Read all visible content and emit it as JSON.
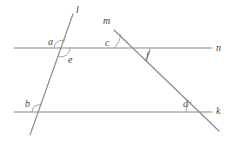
{
  "figure": {
    "type": "geometry-diagram",
    "background_color": "#ffffff",
    "line_color": "#8a8a8a",
    "arc_color": "#9a9a9a",
    "label_color": "#4a4a4a"
  },
  "lines": [
    {
      "id": "line-n",
      "label": "n",
      "role": "horizontal-upper",
      "x1": 14,
      "y1": 48,
      "x2": 212,
      "y2": 48,
      "label_x": 216,
      "label_y": 43
    },
    {
      "id": "line-k",
      "label": "k",
      "role": "horizontal-lower",
      "x1": 14,
      "y1": 112,
      "x2": 212,
      "y2": 112,
      "label_x": 216,
      "label_y": 106
    },
    {
      "id": "line-l",
      "label": "l",
      "role": "transversal-left",
      "x1": 73,
      "y1": 14,
      "x2": 30,
      "y2": 135,
      "label_x": 76,
      "label_y": 5
    },
    {
      "id": "line-m",
      "label": "m",
      "role": "transversal-right",
      "x1": 114,
      "y1": 30,
      "x2": 219,
      "y2": 131,
      "label_x": 103,
      "label_y": 16
    }
  ],
  "intersections": [
    {
      "id": "int-l-n",
      "lines": [
        "l",
        "n"
      ],
      "x": 62,
      "y": 48
    },
    {
      "id": "int-m-n",
      "lines": [
        "m",
        "n"
      ],
      "x": 132,
      "y": 48
    },
    {
      "id": "int-l-k",
      "lines": [
        "l",
        "k"
      ],
      "x": 39,
      "y": 112
    },
    {
      "id": "int-m-k",
      "lines": [
        "m",
        "k"
      ],
      "x": 198,
      "y": 112
    }
  ],
  "angles": [
    {
      "id": "angle-a",
      "label": "a",
      "at": "int-l-n",
      "position": "upper-left",
      "label_x": 48,
      "label_y": 37
    },
    {
      "id": "angle-e",
      "label": "e",
      "at": "int-l-n",
      "position": "lower-right",
      "label_x": 68,
      "label_y": 55
    },
    {
      "id": "angle-c",
      "label": "c",
      "at": "int-m-n",
      "position": "upper-left",
      "label_x": 105,
      "label_y": 38
    },
    {
      "id": "angle-f",
      "label": "f",
      "at": "int-m-n",
      "position": "lower-right",
      "label_x": 146,
      "label_y": 51
    },
    {
      "id": "angle-b",
      "label": "b",
      "at": "int-l-k",
      "position": "upper-left",
      "label_x": 25,
      "label_y": 99
    },
    {
      "id": "angle-d",
      "label": "d",
      "at": "int-m-k",
      "position": "upper-left",
      "label_x": 183,
      "label_y": 99
    }
  ]
}
